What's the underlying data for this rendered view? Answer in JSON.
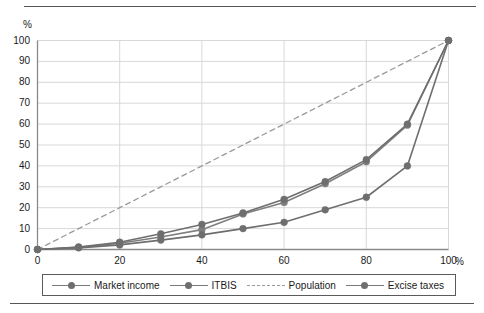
{
  "chart_data": {
    "type": "line",
    "title": "",
    "xlabel": "%",
    "ylabel": "%",
    "xlim": [
      0,
      100
    ],
    "ylim": [
      0,
      100
    ],
    "grid": true,
    "legend_position": "bottom",
    "x": [
      0,
      10,
      20,
      30,
      40,
      50,
      60,
      70,
      80,
      90,
      100
    ],
    "xticks": [
      "0",
      "20",
      "40",
      "60",
      "80",
      "100"
    ],
    "xtick_values": [
      0,
      20,
      40,
      60,
      80,
      100
    ],
    "yticks": [
      "0",
      "10",
      "20",
      "30",
      "40",
      "50",
      "60",
      "70",
      "80",
      "90",
      "100"
    ],
    "ytick_values": [
      0,
      10,
      20,
      30,
      40,
      50,
      60,
      70,
      80,
      90,
      100
    ],
    "series": [
      {
        "name": "Market income",
        "color": "#7f7f7f",
        "style": "solid-marker",
        "values": [
          0,
          1,
          3,
          6,
          9.5,
          17,
          22.5,
          31.5,
          42,
          59.5,
          100
        ]
      },
      {
        "name": "ITBIS",
        "color": "#6e6e6e",
        "style": "solid-marker",
        "values": [
          0,
          1.2,
          3.5,
          7.5,
          12,
          17.5,
          24,
          32.5,
          43,
          60,
          100
        ]
      },
      {
        "name": "Population",
        "color": "#9a9a9a",
        "style": "dashed",
        "values": [
          0,
          10,
          20,
          30,
          40,
          50,
          60,
          70,
          80,
          90,
          100
        ]
      },
      {
        "name": "Excise taxes",
        "color": "#6e6e6e",
        "style": "solid-marker",
        "values": [
          0,
          0.8,
          2.2,
          4.5,
          7,
          10,
          13,
          19,
          25,
          40,
          100
        ]
      }
    ]
  },
  "axis": {
    "y_unit": "%",
    "x_unit": "%"
  },
  "legend": {
    "items": [
      {
        "label": "Market income",
        "style": "solid-marker"
      },
      {
        "label": "ITBIS",
        "style": "solid-marker"
      },
      {
        "label": "Population",
        "style": "dashed"
      },
      {
        "label": "Excise taxes",
        "style": "solid-marker"
      }
    ]
  }
}
